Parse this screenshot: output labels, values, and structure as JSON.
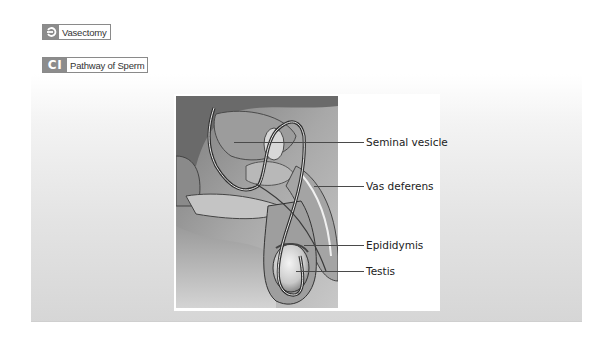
{
  "headings": [
    {
      "badge_icon": "return-arrow-icon",
      "badge_glyph": "⊃",
      "label": "Vasectomy"
    },
    {
      "badge_icon": "ci-badge",
      "badge_glyph": "CI",
      "label": "Pathway of Sperm"
    }
  ],
  "figure": {
    "labels": [
      {
        "text": "Seminal vesicle",
        "y": 142
      },
      {
        "text": "Vas deferens",
        "y": 186
      },
      {
        "text": "Epididymis",
        "y": 245
      },
      {
        "text": "Testis",
        "y": 271
      }
    ]
  },
  "colors": {
    "badge": "#8c8c8c",
    "border": "#8a8a8a",
    "text": "#222222",
    "panel_bottom": "#d6d6d6"
  }
}
